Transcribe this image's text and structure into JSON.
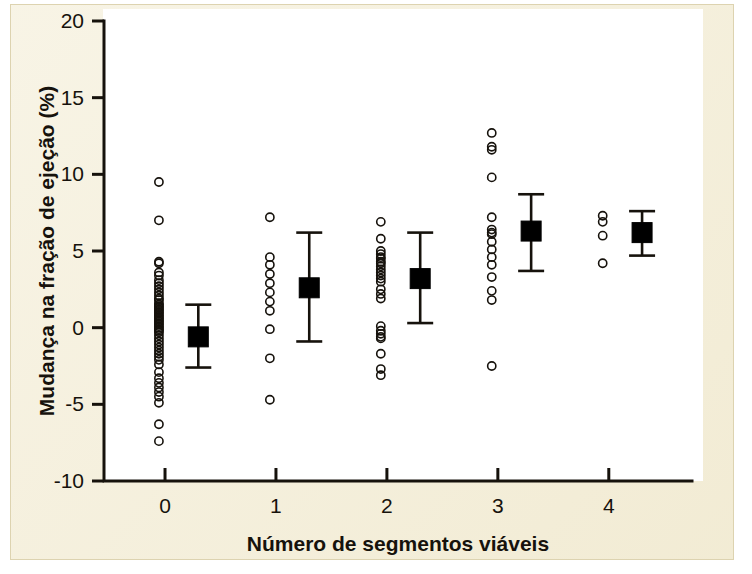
{
  "figure": {
    "panel_bg": "#f4eed8",
    "plot_bg": "#ffffff",
    "ink": "#16120c"
  },
  "chart_data": {
    "type": "scatter",
    "title": "",
    "subtitle": "",
    "xlabel": "Número de segmentos viáveis",
    "ylabel": "Mudança na fração de ejeção (%)",
    "xlim": [
      -0.55,
      4.75
    ],
    "ylim": [
      -10,
      20
    ],
    "xticks": [
      0,
      1,
      2,
      3,
      4
    ],
    "xticklabels": [
      "0",
      "1",
      "2",
      "3",
      "4"
    ],
    "yticks": [
      -10,
      -5,
      0,
      5,
      10,
      15,
      20
    ],
    "yticklabels": [
      "-10",
      "-5",
      "0",
      "5",
      "10",
      "15",
      "20"
    ],
    "grid": false,
    "legend": null,
    "marker_style": {
      "raw": "open-circle",
      "summary": "filled-square-with-error-bars"
    },
    "groups": [
      {
        "x": 0,
        "label": "0",
        "n": 53,
        "mean": -0.6,
        "err_low": -2.6,
        "err_high": 1.5,
        "values": [
          9.5,
          7.0,
          4.3,
          4.2,
          3.6,
          3.4,
          3.1,
          2.9,
          2.7,
          2.5,
          2.3,
          2.1,
          1.9,
          1.8,
          1.6,
          1.5,
          1.4,
          1.3,
          1.2,
          1.1,
          1.0,
          0.9,
          0.8,
          0.7,
          0.6,
          0.5,
          0.4,
          0.3,
          0.2,
          0.1,
          0.0,
          -0.1,
          -0.2,
          -0.3,
          -0.5,
          -0.7,
          -0.9,
          -1.1,
          -1.3,
          -1.5,
          -1.7,
          -1.9,
          -2.1,
          -2.4,
          -2.9,
          -3.3,
          -3.6,
          -3.9,
          -4.2,
          -4.5,
          -4.9,
          -6.3,
          -7.4
        ]
      },
      {
        "x": 1,
        "label": "1",
        "n": 10,
        "mean": 2.6,
        "err_low": -0.9,
        "err_high": 6.2,
        "values": [
          7.2,
          4.6,
          4.1,
          3.5,
          2.9,
          2.3,
          1.7,
          1.1,
          -0.1,
          -2.0,
          -4.7
        ]
      },
      {
        "x": 2,
        "label": "2",
        "n": 24,
        "mean": 3.2,
        "err_low": 0.3,
        "err_high": 6.2,
        "values": [
          6.9,
          5.8,
          5.0,
          4.8,
          4.6,
          4.5,
          4.3,
          4.2,
          4.0,
          3.8,
          3.6,
          3.4,
          3.2,
          3.0,
          2.5,
          2.2,
          1.9,
          0.1,
          -0.2,
          -0.4,
          -0.6,
          -0.7,
          -1.7,
          -2.7,
          -3.1
        ]
      },
      {
        "x": 3,
        "label": "3",
        "n": 16,
        "mean": 6.3,
        "err_low": 3.7,
        "err_high": 8.7,
        "values": [
          12.7,
          11.8,
          11.6,
          9.8,
          7.2,
          6.4,
          6.2,
          6.1,
          5.6,
          5.1,
          4.6,
          4.1,
          3.3,
          2.4,
          1.8,
          -2.5
        ]
      },
      {
        "x": 4,
        "label": "4",
        "n": 4,
        "mean": 6.2,
        "err_low": 4.7,
        "err_high": 7.6,
        "values": [
          7.3,
          6.9,
          6.0,
          4.2
        ]
      }
    ]
  }
}
